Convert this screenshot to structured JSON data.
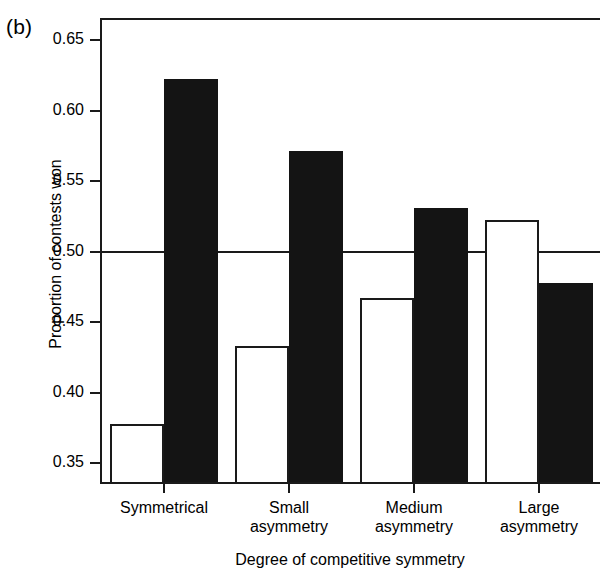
{
  "panel": {
    "label": "(b)"
  },
  "chart_data": {
    "type": "bar",
    "title": "",
    "panel_label": "(b)",
    "xlabel": "Degree of competitive symmetry",
    "ylabel": "Proportion of contests won",
    "categories": [
      "Symmetrical",
      "Small\nasymmetry",
      "Medium\nasymmetry",
      "Large\nasymmetry"
    ],
    "category_lines": [
      [
        "Symmetrical"
      ],
      [
        "Small",
        "asymmetry"
      ],
      [
        "Medium",
        "asymmetry"
      ],
      [
        "Large",
        "asymmetry"
      ]
    ],
    "series": [
      {
        "name": "open",
        "fill": "#ffffff",
        "values": [
          0.378,
          0.433,
          0.467,
          0.522
        ]
      },
      {
        "name": "filled",
        "fill": "#141414",
        "values": [
          0.622,
          0.571,
          0.531,
          0.478
        ]
      }
    ],
    "ylim": [
      0.333,
      0.665
    ],
    "yticks": [
      0.35,
      0.4,
      0.45,
      0.5,
      0.55,
      0.6,
      0.65
    ],
    "ytick_labels": [
      "0.35",
      "0.40",
      "0.45",
      "0.50",
      "0.55",
      "0.60",
      "0.65"
    ],
    "reference_line": 0.5,
    "grid": false,
    "legend": "none",
    "axis_color": "#1a1a1a"
  }
}
